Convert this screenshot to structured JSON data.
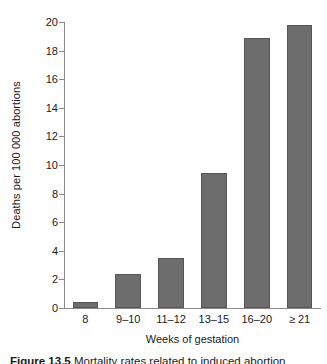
{
  "chart_data": {
    "type": "bar",
    "title": "",
    "xlabel": "Weeks of gestation",
    "ylabel": "Deaths per 100 000 abortions",
    "categories": [
      "8",
      "9–10",
      "11–12",
      "13–15",
      "16–20",
      "≥ 21"
    ],
    "values": [
      0.45,
      2.4,
      3.5,
      9.45,
      18.9,
      19.8
    ],
    "ylim": [
      0,
      20
    ],
    "yticks": [
      0,
      2,
      4,
      6,
      8,
      10,
      12,
      14,
      16,
      18,
      20
    ],
    "ytick_labels": [
      "0",
      "2",
      "4",
      "6",
      "8",
      "10",
      "12",
      "14",
      "16",
      "18",
      "20"
    ],
    "grid": false,
    "legend": false,
    "bar_color": "#6d6d6d",
    "bar_edge_color": "#565656",
    "axis_color": "#8a8a8a",
    "text_color": "#1a1a1a",
    "background": "#ffffff"
  },
  "caption": {
    "label": "Figure 13.5",
    "rest": "  Mortality rates related to induced abortion"
  }
}
